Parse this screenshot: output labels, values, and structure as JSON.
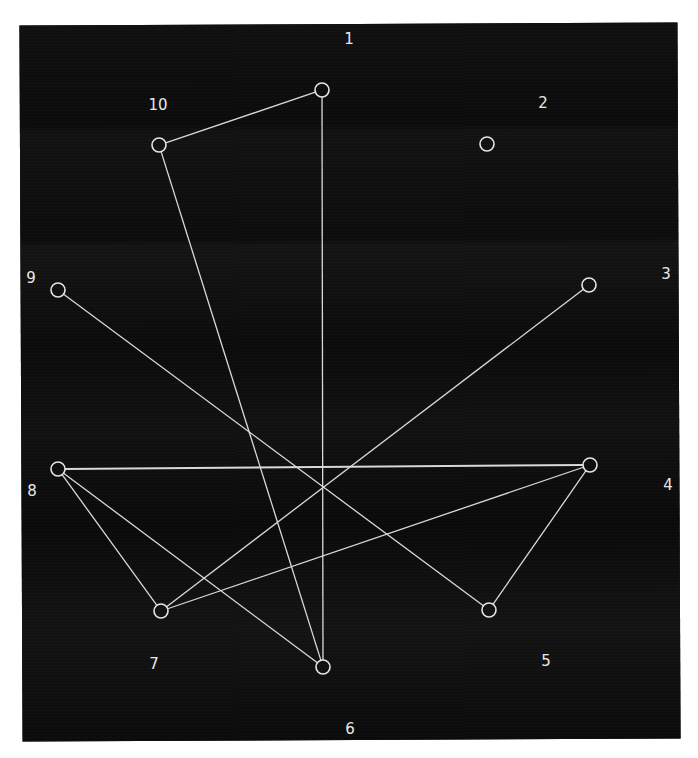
{
  "figure": {
    "background_color": "#0d0d0d",
    "edge_color": "#d9d9d9",
    "node_color": "#e6e6e6",
    "label_color": "#e8e8e8",
    "caption_visible": "partially cropped at bottom edge (illegible)"
  },
  "graph": {
    "nodes": [
      {
        "id": "1",
        "label": "1",
        "cx": 322,
        "cy": 90,
        "lx": 349,
        "ly": 44
      },
      {
        "id": "2",
        "label": "2",
        "cx": 487,
        "cy": 144,
        "lx": 543,
        "ly": 108
      },
      {
        "id": "3",
        "label": "3",
        "cx": 589,
        "cy": 285,
        "lx": 666,
        "ly": 279
      },
      {
        "id": "4",
        "label": "4",
        "cx": 590,
        "cy": 465,
        "lx": 668,
        "ly": 490
      },
      {
        "id": "5",
        "label": "5",
        "cx": 489,
        "cy": 610,
        "lx": 546,
        "ly": 666
      },
      {
        "id": "6",
        "label": "6",
        "cx": 323,
        "cy": 667,
        "lx": 350,
        "ly": 734
      },
      {
        "id": "7",
        "label": "7",
        "cx": 161,
        "cy": 611,
        "lx": 154,
        "ly": 669
      },
      {
        "id": "8",
        "label": "8",
        "cx": 58,
        "cy": 469,
        "lx": 32,
        "ly": 496
      },
      {
        "id": "9",
        "label": "9",
        "cx": 58,
        "cy": 290,
        "lx": 31,
        "ly": 283
      },
      {
        "id": "10",
        "label": "10",
        "cx": 159,
        "cy": 145,
        "lx": 158,
        "ly": 110
      }
    ],
    "edges": [
      {
        "from": "1",
        "to": "10"
      },
      {
        "from": "1",
        "to": "6"
      },
      {
        "from": "10",
        "to": "6"
      },
      {
        "from": "9",
        "to": "5"
      },
      {
        "from": "5",
        "to": "4"
      },
      {
        "from": "3",
        "to": "7"
      },
      {
        "from": "8",
        "to": "4",
        "emphasis": "thick"
      },
      {
        "from": "8",
        "to": "7"
      },
      {
        "from": "8",
        "to": "6"
      },
      {
        "from": "7",
        "to": "4"
      }
    ],
    "isolated_nodes": [
      "2"
    ],
    "node_radius": 7
  }
}
